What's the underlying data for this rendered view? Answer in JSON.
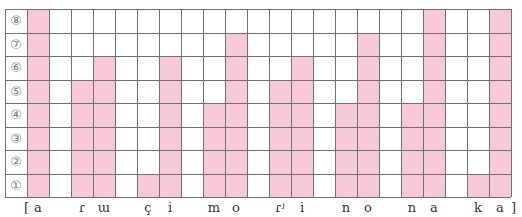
{
  "chart_data": {
    "type": "bar",
    "title": "",
    "xlabel": "",
    "ylabel": "",
    "ylim": [
      0,
      8
    ],
    "grid": true,
    "row_labels": [
      "①",
      "②",
      "③",
      "④",
      "⑤",
      "⑥",
      "⑦",
      "⑧"
    ],
    "open_bracket": "[",
    "close_bracket": "]",
    "columns": [
      {
        "label": "a",
        "value": 8
      },
      {
        "label": "",
        "value": 0
      },
      {
        "label": "ɾ",
        "value": 5
      },
      {
        "label": "ɯ",
        "value": 6
      },
      {
        "label": "",
        "value": 0
      },
      {
        "label": "ç",
        "value": 1
      },
      {
        "label": "i",
        "value": 6
      },
      {
        "label": "",
        "value": 0
      },
      {
        "label": "m",
        "value": 4
      },
      {
        "label": "o",
        "value": 7
      },
      {
        "label": "",
        "value": 0
      },
      {
        "label": "ɾʲ",
        "value": 5
      },
      {
        "label": "i",
        "value": 6
      },
      {
        "label": "",
        "value": 0
      },
      {
        "label": "n",
        "value": 4
      },
      {
        "label": "o",
        "value": 7
      },
      {
        "label": "",
        "value": 0
      },
      {
        "label": "n",
        "value": 4
      },
      {
        "label": "a",
        "value": 8
      },
      {
        "label": "",
        "value": 0
      },
      {
        "label": "k",
        "value": 1
      },
      {
        "label": "a",
        "value": 8
      }
    ],
    "colors": {
      "fill": "#f7c8d6",
      "grid": "#707070",
      "label": "#333333"
    }
  }
}
